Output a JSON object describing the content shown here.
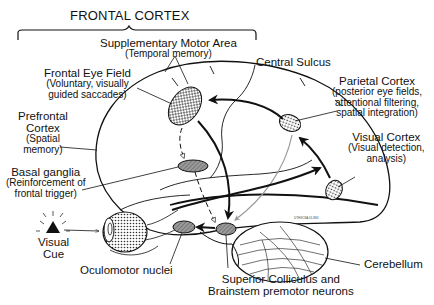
{
  "title": "FRONTAL CORTEX",
  "regions": {
    "supplementary_motor_area": {
      "name": "Supplementary Motor Area",
      "function": "(Temporal memory)"
    },
    "frontal_eye_field": {
      "name": "Frontal Eye Field",
      "function_line1": "(Voluntary, visually",
      "function_line2": "guided saccades)"
    },
    "prefrontal_cortex": {
      "name_line1": "Prefrontal",
      "name_line2": "Cortex",
      "function_line1": "(Spatial",
      "function_line2": "memory)"
    },
    "central_sulcus": {
      "name": "Central Sulcus"
    },
    "parietal_cortex": {
      "name": "Parietal Cortex",
      "function_line1": "(posterior eye fields,",
      "function_line2": "attentional filtering,",
      "function_line3": "spatial integration)"
    },
    "visual_cortex": {
      "name": "Visual Cortex",
      "function_line1": "(Visual detection,",
      "function_line2": "analysis)"
    },
    "basal_ganglia": {
      "name": "Basal ganglia",
      "function_line1": "(Reinforcement of",
      "function_line2": "frontal trigger)"
    },
    "visual_cue": {
      "name_line1": "Visual",
      "name_line2": "Cue"
    },
    "oculomotor_nuclei": {
      "name": "Oculomotor nuclei"
    },
    "superior_colliculus": {
      "name_line1": "Superior Colliculus and",
      "name_line2": "Brainstem premotor neurons"
    },
    "cerebellum": {
      "name": "Cerebellum"
    }
  },
  "fine_print": "UTHSCSA 01-884",
  "colors": {
    "ink": "#111111",
    "gray_arrow": "#9a9a9a",
    "region_fill": "#888888",
    "background": "#ffffff"
  }
}
